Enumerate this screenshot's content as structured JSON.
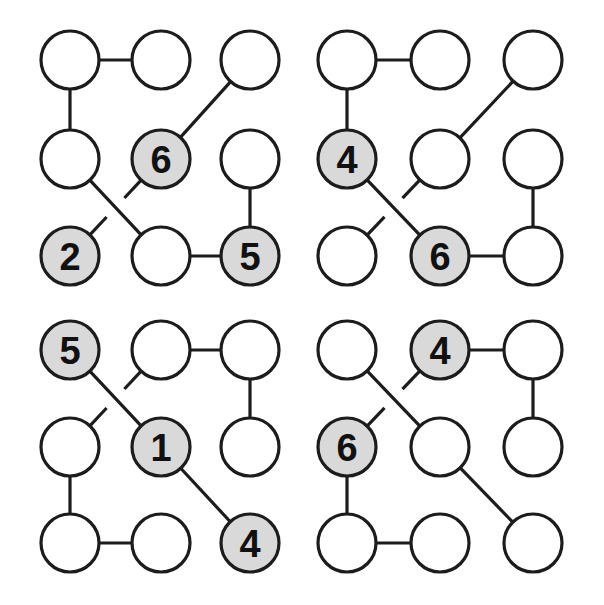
{
  "figure": {
    "width": 604,
    "height": 605,
    "background_color": "#ffffff",
    "panel_count": 4,
    "panel_layout": "2x2",
    "node_radius": 29,
    "edge_color": "#1c1c1c",
    "edge_width": 3.2,
    "node_stroke_color": "#1c1c1c",
    "node_fill_plain": "#ffffff",
    "node_fill_shaded": "#d9d9d9",
    "label_color": "#111111",
    "crossing_style": "gap-break"
  },
  "grid": {
    "columns_x": [
      70,
      161,
      250,
      347,
      440,
      533
    ],
    "rows_y": [
      60,
      159,
      256,
      350,
      447,
      543
    ]
  },
  "panels": [
    {
      "id": "panel-top-left",
      "name": "top-left",
      "col_offset": 0,
      "row_offset": 0,
      "labels": [
        "6",
        "2",
        "5"
      ],
      "nodes": [
        {
          "id": "tl-r1c1",
          "col": 0,
          "row": 0,
          "shaded": false,
          "label": ""
        },
        {
          "id": "tl-r1c2",
          "col": 1,
          "row": 0,
          "shaded": false,
          "label": ""
        },
        {
          "id": "tl-r1c3",
          "col": 2,
          "row": 0,
          "shaded": false,
          "label": ""
        },
        {
          "id": "tl-r2c1",
          "col": 0,
          "row": 1,
          "shaded": false,
          "label": ""
        },
        {
          "id": "tl-r2c2",
          "col": 1,
          "row": 1,
          "shaded": true,
          "label": "6"
        },
        {
          "id": "tl-r2c3",
          "col": 2,
          "row": 1,
          "shaded": false,
          "label": ""
        },
        {
          "id": "tl-r3c1",
          "col": 0,
          "row": 2,
          "shaded": true,
          "label": "2"
        },
        {
          "id": "tl-r3c2",
          "col": 1,
          "row": 2,
          "shaded": false,
          "label": ""
        },
        {
          "id": "tl-r3c3",
          "col": 2,
          "row": 2,
          "shaded": true,
          "label": "5"
        }
      ],
      "edges": [
        {
          "from": "tl-r1c1",
          "to": "tl-r1c2",
          "kind": "straight"
        },
        {
          "from": "tl-r1c1",
          "to": "tl-r2c1",
          "kind": "straight"
        },
        {
          "from": "tl-r1c3",
          "to": "tl-r2c2",
          "kind": "straight"
        },
        {
          "from": "tl-r2c1",
          "to": "tl-r3c2",
          "kind": "straight"
        },
        {
          "from": "tl-r3c1",
          "to": "tl-r2c2",
          "kind": "broken"
        },
        {
          "from": "tl-r3c2",
          "to": "tl-r3c3",
          "kind": "straight"
        },
        {
          "from": "tl-r2c3",
          "to": "tl-r3c3",
          "kind": "straight"
        }
      ]
    },
    {
      "id": "panel-top-right",
      "name": "top-right",
      "col_offset": 3,
      "row_offset": 0,
      "labels": [
        "4",
        "6"
      ],
      "nodes": [
        {
          "id": "tr-r1c1",
          "col": 3,
          "row": 0,
          "shaded": false,
          "label": ""
        },
        {
          "id": "tr-r1c2",
          "col": 4,
          "row": 0,
          "shaded": false,
          "label": ""
        },
        {
          "id": "tr-r1c3",
          "col": 5,
          "row": 0,
          "shaded": false,
          "label": ""
        },
        {
          "id": "tr-r2c1",
          "col": 3,
          "row": 1,
          "shaded": true,
          "label": "4"
        },
        {
          "id": "tr-r2c2",
          "col": 4,
          "row": 1,
          "shaded": false,
          "label": ""
        },
        {
          "id": "tr-r2c3",
          "col": 5,
          "row": 1,
          "shaded": false,
          "label": ""
        },
        {
          "id": "tr-r3c1",
          "col": 3,
          "row": 2,
          "shaded": false,
          "label": ""
        },
        {
          "id": "tr-r3c2",
          "col": 4,
          "row": 2,
          "shaded": true,
          "label": "6"
        },
        {
          "id": "tr-r3c3",
          "col": 5,
          "row": 2,
          "shaded": false,
          "label": ""
        }
      ],
      "edges": [
        {
          "from": "tr-r1c1",
          "to": "tr-r1c2",
          "kind": "straight"
        },
        {
          "from": "tr-r1c1",
          "to": "tr-r2c1",
          "kind": "straight"
        },
        {
          "from": "tr-r1c3",
          "to": "tr-r2c2",
          "kind": "straight"
        },
        {
          "from": "tr-r2c1",
          "to": "tr-r3c2",
          "kind": "straight"
        },
        {
          "from": "tr-r3c1",
          "to": "tr-r2c2",
          "kind": "broken"
        },
        {
          "from": "tr-r3c2",
          "to": "tr-r3c3",
          "kind": "straight"
        },
        {
          "from": "tr-r2c3",
          "to": "tr-r3c3",
          "kind": "straight"
        }
      ]
    },
    {
      "id": "panel-bottom-left",
      "name": "bottom-left",
      "col_offset": 0,
      "row_offset": 3,
      "labels": [
        "5",
        "1",
        "4"
      ],
      "nodes": [
        {
          "id": "bl-r1c1",
          "col": 0,
          "row": 3,
          "shaded": true,
          "label": "5"
        },
        {
          "id": "bl-r1c2",
          "col": 1,
          "row": 3,
          "shaded": false,
          "label": ""
        },
        {
          "id": "bl-r1c3",
          "col": 2,
          "row": 3,
          "shaded": false,
          "label": ""
        },
        {
          "id": "bl-r2c1",
          "col": 0,
          "row": 4,
          "shaded": false,
          "label": ""
        },
        {
          "id": "bl-r2c2",
          "col": 1,
          "row": 4,
          "shaded": true,
          "label": "1"
        },
        {
          "id": "bl-r2c3",
          "col": 2,
          "row": 4,
          "shaded": false,
          "label": ""
        },
        {
          "id": "bl-r3c1",
          "col": 0,
          "row": 5,
          "shaded": false,
          "label": ""
        },
        {
          "id": "bl-r3c2",
          "col": 1,
          "row": 5,
          "shaded": false,
          "label": ""
        },
        {
          "id": "bl-r3c3",
          "col": 2,
          "row": 5,
          "shaded": true,
          "label": "4"
        }
      ],
      "edges": [
        {
          "from": "bl-r1c2",
          "to": "bl-r1c3",
          "kind": "straight"
        },
        {
          "from": "bl-r1c1",
          "to": "bl-r2c2",
          "kind": "straight"
        },
        {
          "from": "bl-r2c1",
          "to": "bl-r1c2",
          "kind": "broken"
        },
        {
          "from": "bl-r1c3",
          "to": "bl-r2c3",
          "kind": "straight"
        },
        {
          "from": "bl-r2c1",
          "to": "bl-r3c1",
          "kind": "straight"
        },
        {
          "from": "bl-r3c1",
          "to": "bl-r3c2",
          "kind": "straight"
        },
        {
          "from": "bl-r2c2",
          "to": "bl-r3c3",
          "kind": "straight"
        }
      ]
    },
    {
      "id": "panel-bottom-right",
      "name": "bottom-right",
      "col_offset": 3,
      "row_offset": 3,
      "labels": [
        "4",
        "6"
      ],
      "nodes": [
        {
          "id": "br-r1c1",
          "col": 3,
          "row": 3,
          "shaded": false,
          "label": ""
        },
        {
          "id": "br-r1c2",
          "col": 4,
          "row": 3,
          "shaded": true,
          "label": "4"
        },
        {
          "id": "br-r1c3",
          "col": 5,
          "row": 3,
          "shaded": false,
          "label": ""
        },
        {
          "id": "br-r2c1",
          "col": 3,
          "row": 4,
          "shaded": true,
          "label": "6"
        },
        {
          "id": "br-r2c2",
          "col": 4,
          "row": 4,
          "shaded": false,
          "label": ""
        },
        {
          "id": "br-r2c3",
          "col": 5,
          "row": 4,
          "shaded": false,
          "label": ""
        },
        {
          "id": "br-r3c1",
          "col": 3,
          "row": 5,
          "shaded": false,
          "label": ""
        },
        {
          "id": "br-r3c2",
          "col": 4,
          "row": 5,
          "shaded": false,
          "label": ""
        },
        {
          "id": "br-r3c3",
          "col": 5,
          "row": 5,
          "shaded": false,
          "label": ""
        }
      ],
      "edges": [
        {
          "from": "br-r1c2",
          "to": "br-r1c3",
          "kind": "straight"
        },
        {
          "from": "br-r1c1",
          "to": "br-r2c2",
          "kind": "straight"
        },
        {
          "from": "br-r2c1",
          "to": "br-r1c2",
          "kind": "broken"
        },
        {
          "from": "br-r1c3",
          "to": "br-r2c3",
          "kind": "straight"
        },
        {
          "from": "br-r2c1",
          "to": "br-r3c1",
          "kind": "straight"
        },
        {
          "from": "br-r3c1",
          "to": "br-r3c2",
          "kind": "straight"
        },
        {
          "from": "br-r2c2",
          "to": "br-r3c3",
          "kind": "straight"
        }
      ]
    }
  ]
}
